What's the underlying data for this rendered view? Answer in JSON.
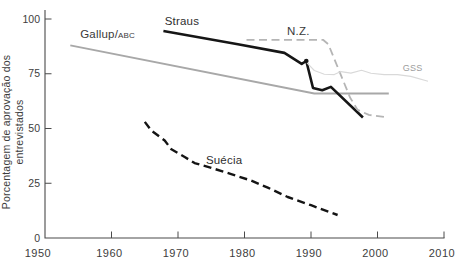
{
  "chart_data": {
    "type": "line",
    "title": "",
    "xlabel": "",
    "ylabel": "Porcentagem de aprovação dos entrevistados",
    "xlim": [
      1950,
      2012
    ],
    "ylim": [
      0,
      100
    ],
    "x_ticks": [
      "1950",
      "1960",
      "1970",
      "1980",
      "1990",
      "2000",
      "2010"
    ],
    "y_ticks": [
      "0",
      "25",
      "50",
      "75",
      "100"
    ],
    "grid": false,
    "legend_position": "inline-labels",
    "axis_color": "#4a4a4a",
    "text_color": "#3d3d3d",
    "series": [
      {
        "id": "gallup",
        "name": "Gallup/ABC",
        "color": "#a8a8a8",
        "style": "solid",
        "width": 1.8,
        "points": [
          [
            1953.8,
            88
          ],
          [
            1990.5,
            66
          ],
          [
            2001.7,
            66
          ]
        ]
      },
      {
        "id": "straus",
        "name": "Straus",
        "color": "#161616",
        "style": "solid",
        "width": 2.6,
        "points": [
          [
            1967.8,
            94.5
          ],
          [
            1979,
            88.5
          ],
          [
            1986,
            84.5
          ],
          [
            1988.6,
            79.5
          ],
          [
            1989.3,
            80.8
          ],
          [
            1990.3,
            68.5
          ],
          [
            1991.7,
            67.5
          ],
          [
            1993,
            69
          ],
          [
            1997.8,
            55
          ]
        ],
        "marker": [
          1989.3,
          80.8
        ]
      },
      {
        "id": "nz",
        "name": "N.Z.",
        "color": "#b5b5b5",
        "style": "dashed",
        "width": 1.8,
        "points": [
          [
            1980.3,
            90.5
          ],
          [
            1991.8,
            90.5
          ],
          [
            1992.6,
            88.5
          ],
          [
            1995.9,
            64
          ],
          [
            1997,
            58.5
          ],
          [
            1998.7,
            56.2
          ],
          [
            2001.3,
            55.2
          ]
        ]
      },
      {
        "id": "gss",
        "name": "GSS",
        "color": "#d9d9d9",
        "style": "solid",
        "width": 1.1,
        "points": [
          [
            1989.4,
            80
          ],
          [
            1990.5,
            76.5
          ],
          [
            1992,
            74.8
          ],
          [
            1993.5,
            74.6
          ],
          [
            1994.5,
            76
          ],
          [
            1996,
            75.3
          ],
          [
            1997.6,
            76.6
          ],
          [
            1999,
            75.2
          ],
          [
            2001,
            74.6
          ],
          [
            2003,
            74.6
          ],
          [
            2005,
            73.8
          ],
          [
            2007.6,
            71.6
          ]
        ]
      },
      {
        "id": "suecia",
        "name": "Suécia",
        "color": "#141414",
        "style": "dashed",
        "width": 2.4,
        "points": [
          [
            1965,
            53
          ],
          [
            1966,
            49
          ],
          [
            1968,
            44.5
          ],
          [
            1969,
            40.5
          ],
          [
            1971,
            37
          ],
          [
            1972.5,
            34.2
          ],
          [
            1975,
            32
          ],
          [
            1978,
            29.2
          ],
          [
            1981,
            26.2
          ],
          [
            1983.5,
            23
          ],
          [
            1986.5,
            18.7
          ],
          [
            1990,
            15
          ],
          [
            1994,
            10.5
          ]
        ]
      }
    ],
    "inline_labels": [
      {
        "id": "gallup",
        "text": "Gallup/",
        "small": "ABC",
        "x": 1955.3,
        "y": 91.3,
        "size": 11.5,
        "color": "#3a3a3a"
      },
      {
        "id": "straus",
        "text": "Straus",
        "x": 1968,
        "y": 97.5,
        "size": 11.5,
        "color": "#2e2e2e"
      },
      {
        "id": "nz",
        "text": "N.Z.",
        "x": 1986.4,
        "y": 92.7,
        "size": 11.5,
        "color": "#3a3a3a"
      },
      {
        "id": "gss",
        "text": "GSS",
        "x": 2003.8,
        "y": 76.3,
        "size": 9,
        "color": "#9c9c9c"
      },
      {
        "id": "suecia",
        "text": "Suécia",
        "x": 1974.2,
        "y": 33.8,
        "size": 11.5,
        "color": "#2e2e2e"
      }
    ]
  }
}
